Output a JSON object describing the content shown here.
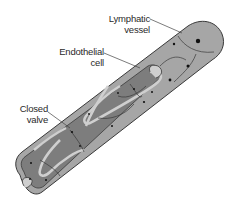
{
  "diagram": {
    "colors": {
      "background": "#ffffff",
      "outer_wall": "#a6a6a6",
      "inner_lumen": "#7d7d7d",
      "valve_flap": "#c9c9c9",
      "cell_border": "#3a3a3a",
      "nucleus": "#111111",
      "leader_line": "#444444"
    },
    "labels": [
      {
        "id": "lymphatic-vessel",
        "line1": "Lymphatic",
        "line2": "vessel"
      },
      {
        "id": "endothelial-cell",
        "line1": "Endothelial",
        "line2": "cell"
      },
      {
        "id": "closed-valve",
        "line1": "Closed",
        "line2": "valve"
      }
    ]
  }
}
